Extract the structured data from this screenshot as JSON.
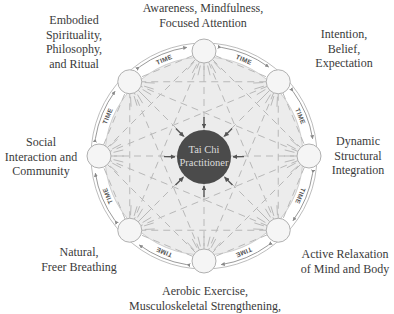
{
  "diagram": {
    "type": "radial-concept",
    "center": {
      "label_line1": "Tai Chi",
      "label_line2": "Practitioner",
      "fill": "#4b4b4b"
    },
    "ring_label": "TIME",
    "colors": {
      "inner_fill": "#ececec",
      "band_fill": "#ffffff",
      "line": "#b5b5b5",
      "node_fill": "#f4f4f4",
      "node_stroke": "#b0b0b0",
      "arrow": "#555555",
      "text": "#3a3a3a"
    },
    "nodes": [
      {
        "id": "top",
        "lines": [
          "Awareness, Mindfulness,",
          "Focused Attention"
        ]
      },
      {
        "id": "top-right",
        "lines": [
          "Intention,",
          "Belief,",
          "Expectation"
        ]
      },
      {
        "id": "right",
        "lines": [
          "Dynamic",
          "Structural",
          "Integration"
        ]
      },
      {
        "id": "bottom-right",
        "lines": [
          "Active Relaxation",
          "of Mind and Body"
        ]
      },
      {
        "id": "bottom",
        "lines": [
          "Aerobic Exercise,",
          "Musculoskeletal Strengthening,"
        ]
      },
      {
        "id": "bottom-left",
        "lines": [
          "Natural,",
          "Freer Breathing"
        ]
      },
      {
        "id": "left",
        "lines": [
          "Social",
          "Interaction and",
          "Community"
        ]
      },
      {
        "id": "top-left",
        "lines": [
          "Embodied",
          "Spirituality,",
          "Philosophy,",
          "and Ritual"
        ]
      }
    ]
  }
}
